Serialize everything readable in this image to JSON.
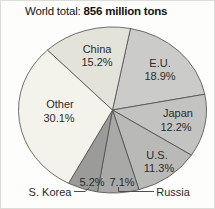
{
  "title": {
    "prefix": "World total: ",
    "bold": "856 million tons"
  },
  "chart_data": {
    "type": "pie",
    "title": "World total: 856 million tons",
    "total_label": "856 million tons",
    "start_angle_deg": 11,
    "direction": "clockwise",
    "outline_color": "#4d4d4d",
    "text_color": "#2b2b2b",
    "slices": [
      {
        "id": "eu",
        "label": "E.U.",
        "value": 18.9,
        "color": "#cbcbc9",
        "label_placement": "inside"
      },
      {
        "id": "japan",
        "label": "Japan",
        "value": 12.2,
        "color": "#c3c3c1",
        "label_placement": "inside"
      },
      {
        "id": "us",
        "label": "U.S.",
        "value": 11.3,
        "color": "#b9b9b7",
        "label_placement": "inside"
      },
      {
        "id": "russia",
        "label": "Russia",
        "value": 7.1,
        "color": "#a9a9a7",
        "label_placement": "callout"
      },
      {
        "id": "skorea",
        "label": "S. Korea",
        "value": 5.2,
        "color": "#9b9b99",
        "label_placement": "callout"
      },
      {
        "id": "other",
        "label": "Other",
        "value": 30.1,
        "color": "#f3f3ec",
        "label_placement": "inside"
      },
      {
        "id": "china",
        "label": "China",
        "value": 15.2,
        "color": "#e4e3da",
        "label_placement": "inside"
      }
    ]
  }
}
